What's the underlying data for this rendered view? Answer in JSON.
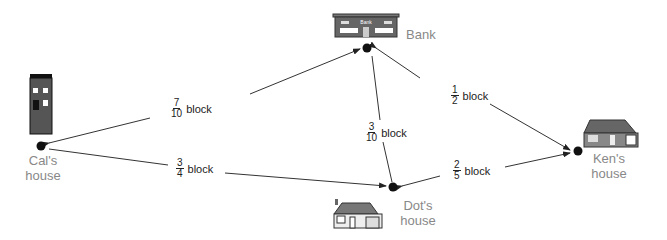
{
  "places": {
    "cal": {
      "name": "Cal's",
      "sub": "house"
    },
    "bank": {
      "name": "Bank"
    },
    "ken": {
      "name": "Ken's",
      "sub": "house"
    },
    "dot": {
      "name": "Dot's",
      "sub": "house"
    }
  },
  "edges": {
    "cal_bank": {
      "num": "7",
      "den": "10",
      "unit": "block"
    },
    "cal_dot": {
      "num": "3",
      "den": "4",
      "unit": "block"
    },
    "bank_dot": {
      "num": "3",
      "den": "10",
      "unit": "block"
    },
    "bank_ken": {
      "num": "1",
      "den": "2",
      "unit": "block"
    },
    "dot_ken": {
      "num": "2",
      "den": "5",
      "unit": "block"
    }
  },
  "bank_sign": "Bank"
}
